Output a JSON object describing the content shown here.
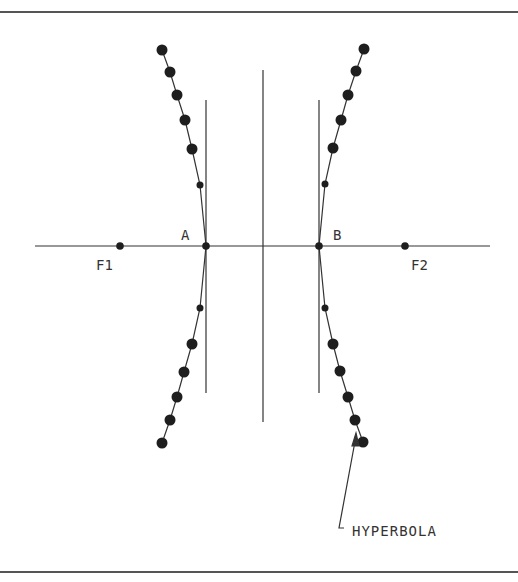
{
  "diagram": {
    "colors": {
      "line": "#333333",
      "dot": "#1e1e1e",
      "border": "#555555",
      "background": "#ffffff"
    },
    "labels": {
      "vertex_left": "A",
      "vertex_right": "B",
      "focus_left": "F1",
      "focus_right": "F2",
      "curve": "HYPERBOLA"
    },
    "axis": {
      "y": 246,
      "x_start": 35,
      "x_end": 490
    },
    "center_line": {
      "x": 263,
      "y_start": 70,
      "y_end": 422
    },
    "directrix_lines": [
      {
        "x": 206,
        "y_start": 100,
        "y_end": 393
      },
      {
        "x": 319,
        "y_start": 100,
        "y_end": 393
      }
    ],
    "points": {
      "A": [
        206,
        246
      ],
      "B": [
        319,
        246
      ],
      "F1": [
        120,
        246
      ],
      "F2": [
        405,
        246
      ]
    },
    "left_branch": [
      [
        162,
        50
      ],
      [
        170,
        72
      ],
      [
        177,
        95
      ],
      [
        185,
        120
      ],
      [
        192,
        149
      ],
      [
        200,
        185
      ],
      [
        206,
        246
      ],
      [
        200,
        308
      ],
      [
        192,
        344
      ],
      [
        184,
        372
      ],
      [
        177,
        397
      ],
      [
        170,
        420
      ],
      [
        162,
        443
      ]
    ],
    "right_branch": [
      [
        364,
        49
      ],
      [
        356,
        71
      ],
      [
        348,
        95
      ],
      [
        341,
        120
      ],
      [
        333,
        148
      ],
      [
        325,
        184
      ],
      [
        319,
        246
      ],
      [
        325,
        308
      ],
      [
        333,
        344
      ],
      [
        340,
        371
      ],
      [
        348,
        397
      ],
      [
        355,
        420
      ],
      [
        363,
        442
      ]
    ],
    "small_dots": [
      [
        200,
        185
      ],
      [
        200,
        308
      ],
      [
        325,
        184
      ],
      [
        325,
        308
      ]
    ]
  }
}
